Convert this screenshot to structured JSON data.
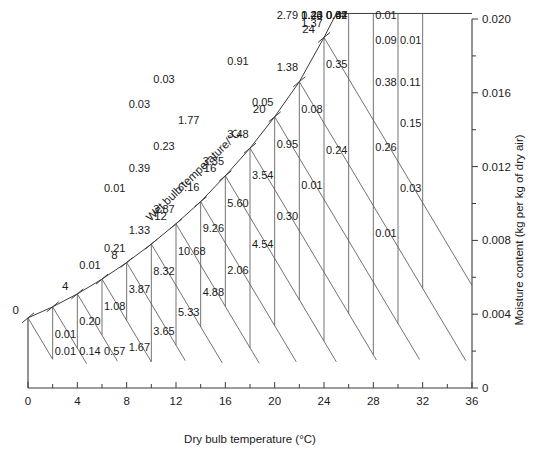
{
  "chart_data": {
    "type": "scatter",
    "title": "",
    "xlabel": "Dry bulb temperature (°C)",
    "ylabel": "Moisture content (kg per kg of dry air)",
    "wet_bulb_axis_label": "Wet bulb temperature/°C",
    "xlim": [
      0,
      36
    ],
    "ylim": [
      0,
      0.02
    ],
    "x_ticks": [
      0,
      4,
      8,
      12,
      16,
      20,
      24,
      28,
      32,
      36
    ],
    "x_tick_labels": [
      "0",
      "4",
      "8",
      "12",
      "16",
      "20",
      "24",
      "28",
      "32",
      "36"
    ],
    "x_minor_step": 2,
    "y_ticks": [
      0,
      0.004,
      0.008,
      0.012,
      0.016,
      0.02
    ],
    "y_tick_labels": [
      "0",
      "0.004",
      "0.008",
      "0.012",
      "0.016",
      "0.020"
    ],
    "y_minor_step": 0.002,
    "grid": false,
    "legend": "none",
    "wet_bulb_labels": [
      "0",
      "4",
      "8",
      "12",
      "16",
      "20",
      "24"
    ],
    "wet_bulb_tick_values": [
      0,
      2,
      4,
      6,
      8,
      10,
      12,
      14,
      16,
      18,
      20,
      22,
      24
    ],
    "saturation_curve": [
      {
        "db": 0,
        "w": 0.0038
      },
      {
        "db": 2,
        "w": 0.0044
      },
      {
        "db": 4,
        "w": 0.0051
      },
      {
        "db": 6,
        "w": 0.0059
      },
      {
        "db": 8,
        "w": 0.0068
      },
      {
        "db": 10,
        "w": 0.0078
      },
      {
        "db": 12,
        "w": 0.0089
      },
      {
        "db": 14,
        "w": 0.0101
      },
      {
        "db": 16,
        "w": 0.0115
      },
      {
        "db": 18,
        "w": 0.013
      },
      {
        "db": 20,
        "w": 0.0147
      },
      {
        "db": 22,
        "w": 0.0166
      },
      {
        "db": 24,
        "w": 0.019
      },
      {
        "db": 25,
        "w": 0.0203
      },
      {
        "db": 36,
        "w": 0.0203
      }
    ],
    "cells": [
      {
        "col": 1,
        "db_left": 2,
        "wb": 0,
        "value": "0.01"
      },
      {
        "col": 1,
        "db_left": 2,
        "wb": 2,
        "value": "0.01"
      },
      {
        "col": 2,
        "db_left": 4,
        "wb": 2,
        "value": "0.14"
      },
      {
        "col": 2,
        "db_left": 4,
        "wb": 4,
        "value": "0.20"
      },
      {
        "col": 2,
        "db_left": 4,
        "wb": 6,
        "value": "0.01"
      },
      {
        "col": 3,
        "db_left": 6,
        "wb": 4,
        "value": "0.57"
      },
      {
        "col": 3,
        "db_left": 6,
        "wb": 6,
        "value": "1.08"
      },
      {
        "col": 3,
        "db_left": 6,
        "wb": 8,
        "value": "0.21"
      },
      {
        "col": 3,
        "db_left": 6,
        "wb": 10,
        "value": "0.01"
      },
      {
        "col": 4,
        "db_left": 8,
        "wb": 6,
        "value": "1.67"
      },
      {
        "col": 4,
        "db_left": 8,
        "wb": 8,
        "value": "3.87"
      },
      {
        "col": 4,
        "db_left": 8,
        "wb": 10,
        "value": "1.33"
      },
      {
        "col": 4,
        "db_left": 8,
        "wb": 12,
        "value": "0.39"
      },
      {
        "col": 4,
        "db_left": 8,
        "wb": 14,
        "value": "0.03"
      },
      {
        "col": 5,
        "db_left": 10,
        "wb": 8,
        "value": "3.65"
      },
      {
        "col": 5,
        "db_left": 10,
        "wb": 10,
        "value": "8.32"
      },
      {
        "col": 5,
        "db_left": 10,
        "wb": 12,
        "value": "3.87"
      },
      {
        "col": 5,
        "db_left": 10,
        "wb": 14,
        "value": "0.23"
      },
      {
        "col": 5,
        "db_left": 10,
        "wb": 16,
        "value": "0.03"
      },
      {
        "col": 6,
        "db_left": 12,
        "wb": 10,
        "value": "5.33"
      },
      {
        "col": 6,
        "db_left": 12,
        "wb": 12,
        "value": "10.68"
      },
      {
        "col": 6,
        "db_left": 12,
        "wb": 14,
        "value": "6.16"
      },
      {
        "col": 6,
        "db_left": 12,
        "wb": 16,
        "value": "1.77"
      },
      {
        "col": 7,
        "db_left": 14,
        "wb": 12,
        "value": "4.88"
      },
      {
        "col": 7,
        "db_left": 14,
        "wb": 14,
        "value": "9.26"
      },
      {
        "col": 7,
        "db_left": 14,
        "wb": 16,
        "value": "3.35"
      },
      {
        "col": 8,
        "db_left": 16,
        "wb": 14,
        "value": "2.06"
      },
      {
        "col": 8,
        "db_left": 16,
        "wb": 16,
        "value": "5.60"
      },
      {
        "col": 8,
        "db_left": 16,
        "wb": 18,
        "value": "3.48"
      },
      {
        "col": 8,
        "db_left": 16,
        "wb": 20,
        "value": "0.91"
      },
      {
        "col": 9,
        "db_left": 18,
        "wb": 16,
        "value": "4.54"
      },
      {
        "col": 9,
        "db_left": 18,
        "wb": 18,
        "value": "3.54"
      },
      {
        "col": 9,
        "db_left": 18,
        "wb": 20,
        "value": "0.05"
      },
      {
        "col": 10,
        "db_left": 20,
        "wb": 18,
        "value": "0.30"
      },
      {
        "col": 10,
        "db_left": 20,
        "wb": 20,
        "value": "0.95"
      },
      {
        "col": 10,
        "db_left": 20,
        "wb": 22,
        "value": "1.38"
      },
      {
        "col": 10,
        "db_left": 20,
        "wb": 24,
        "value": "2.79"
      },
      {
        "col": 11,
        "db_left": 22,
        "wb": 20,
        "value": "0.01"
      },
      {
        "col": 11,
        "db_left": 22,
        "wb": 22,
        "value": "0.08"
      },
      {
        "col": 11,
        "db_left": 22,
        "wb": 24,
        "value": "1.37"
      },
      {
        "col": 11,
        "db_left": 22,
        "wb": 26,
        "value": "1.43"
      },
      {
        "col": 11,
        "db_left": 22,
        "wb": 28,
        "value": "1.20"
      },
      {
        "col": 11,
        "db_left": 22,
        "wb": 30,
        "value": "0.24"
      },
      {
        "col": 12,
        "db_left": 24,
        "wb": 22,
        "value": "0.24"
      },
      {
        "col": 12,
        "db_left": 24,
        "wb": 24,
        "value": "0.35"
      },
      {
        "col": 12,
        "db_left": 24,
        "wb": 26,
        "value": "0.87"
      },
      {
        "col": 12,
        "db_left": 24,
        "wb": 28,
        "value": "0.42"
      },
      {
        "col": 12,
        "db_left": 24,
        "wb": 30,
        "value": "0.04"
      },
      {
        "col": 13,
        "db_left": 28,
        "wb": 22,
        "value": "0.01"
      },
      {
        "col": 13,
        "db_left": 28,
        "wb": 24,
        "value": "0.26"
      },
      {
        "col": 13,
        "db_left": 28,
        "wb": 26,
        "value": "0.38"
      },
      {
        "col": 13,
        "db_left": 28,
        "wb": 28,
        "value": "0.09"
      },
      {
        "col": 13,
        "db_left": 28,
        "wb": 30,
        "value": "0.01"
      },
      {
        "col": 14,
        "db_left": 30,
        "wb": 24,
        "value": "0.03"
      },
      {
        "col": 14,
        "db_left": 30,
        "wb": 26,
        "value": "0.15"
      },
      {
        "col": 14,
        "db_left": 30,
        "wb": 28,
        "value": "0.11"
      },
      {
        "col": 14,
        "db_left": 30,
        "wb": 30,
        "value": "0.01"
      }
    ],
    "values_flat": [
      "0.01",
      "0.01",
      "0.14",
      "0.20",
      "0.01",
      "0.57",
      "1.08",
      "0.21",
      "0.01",
      "1.67",
      "3.87",
      "1.33",
      "0.39",
      "0.03",
      "3.65",
      "8.32",
      "3.87",
      "0.23",
      "0.03",
      "5.33",
      "10.68",
      "6.16",
      "1.77",
      "4.88",
      "9.26",
      "3.35",
      "2.06",
      "5.60",
      "3.48",
      "0.91",
      "4.54",
      "3.54",
      "0.05",
      "0.30",
      "0.95",
      "1.38",
      "2.79",
      "0.01",
      "0.08",
      "1.37",
      "1.43",
      "1.20",
      "0.24",
      "0.24",
      "0.35",
      "0.87",
      "0.42",
      "0.04",
      "0.01",
      "0.26",
      "0.38",
      "0.09",
      "0.01",
      "0.03",
      "0.15",
      "0.11",
      "0.01"
    ]
  },
  "colors": {
    "axis": "#3b3b3b",
    "grid": "#5a5a5a",
    "text": "#1a1a1a",
    "background": "#ffffff"
  }
}
